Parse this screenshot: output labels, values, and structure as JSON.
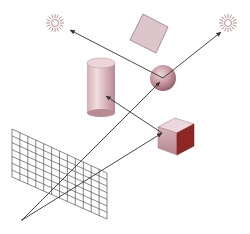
{
  "diagram": {
    "title": "Ray tracing diagram",
    "colors": {
      "background": "#ffffff",
      "ray": "#333333",
      "light": "#b07070",
      "object_light": "#e8d0d4",
      "object_mid": "#c89aa2",
      "object_dark": "#8a2a2a",
      "grid": "#555555"
    },
    "elements": [
      {
        "id": "light-left",
        "type": "light",
        "x": 55,
        "y": 23
      },
      {
        "id": "light-right",
        "type": "light",
        "x": 228,
        "y": 23
      },
      {
        "id": "tilted-square",
        "type": "square"
      },
      {
        "id": "sphere",
        "type": "sphere",
        "x": 163,
        "y": 78,
        "r": 13
      },
      {
        "id": "cylinder",
        "type": "cylinder"
      },
      {
        "id": "cube",
        "type": "cube"
      },
      {
        "id": "image-plane-grid",
        "type": "grid",
        "columns": 12,
        "rows": 7
      },
      {
        "id": "eye-point",
        "type": "camera",
        "x": 22,
        "y": 220
      }
    ],
    "rays": [
      {
        "from": "eye-point",
        "to": "sphere"
      },
      {
        "from": "sphere",
        "to": "light-right"
      },
      {
        "from": "sphere",
        "to": "light-left"
      },
      {
        "from": "eye-point",
        "to": "cube"
      },
      {
        "from": "cube",
        "to": "cylinder"
      }
    ]
  }
}
